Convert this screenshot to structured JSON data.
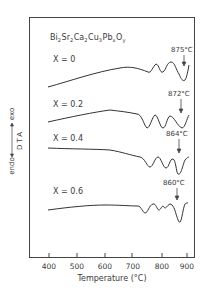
{
  "chart_data": {
    "type": "line",
    "formula": {
      "parts": [
        {
          "base": "Bi",
          "sub": "2"
        },
        {
          "base": "Sr",
          "sub": "2"
        },
        {
          "base": "Ca",
          "sub": "2"
        },
        {
          "base": "Cu",
          "sub": "3"
        },
        {
          "base": "Pb",
          "sub": "x"
        },
        {
          "base": "O",
          "sub": "y"
        }
      ]
    },
    "xlabel": "Temperature (°C)",
    "ylabel": "DTA",
    "ylabel_exo": "exo",
    "ylabel_endo": "endo",
    "xlim": [
      380,
      920
    ],
    "x_ticks": [
      400,
      500,
      600,
      700,
      800,
      900
    ],
    "x_tick_labels": [
      "400",
      "500",
      "600",
      "700",
      "800",
      "900"
    ],
    "grid": false,
    "series": [
      {
        "name": "X = 0",
        "peak_label": "875°C",
        "peak_temp": 875,
        "points": [
          [
            400,
            0.0
          ],
          [
            500,
            0.8
          ],
          [
            600,
            1.4
          ],
          [
            660,
            1.5
          ],
          [
            700,
            1.3
          ],
          [
            740,
            1.1
          ],
          [
            765,
            0.7
          ],
          [
            780,
            1.1
          ],
          [
            800,
            0.5
          ],
          [
            820,
            1.2
          ],
          [
            840,
            1.0
          ],
          [
            860,
            0.3
          ],
          [
            875,
            -0.5
          ],
          [
            890,
            0.3
          ],
          [
            900,
            1.1
          ]
        ]
      },
      {
        "name": "X = 0.2",
        "peak_label": "872°C",
        "peak_temp": 872,
        "points": [
          [
            400,
            0.0
          ],
          [
            500,
            0.7
          ],
          [
            600,
            1.0
          ],
          [
            650,
            0.9
          ],
          [
            700,
            0.8
          ],
          [
            720,
            0.1
          ],
          [
            745,
            -0.5
          ],
          [
            770,
            0.8
          ],
          [
            790,
            -0.1
          ],
          [
            800,
            -0.5
          ],
          [
            815,
            0.8
          ],
          [
            840,
            0.7
          ],
          [
            860,
            -0.2
          ],
          [
            872,
            -0.5
          ],
          [
            885,
            0.2
          ],
          [
            900,
            0.9
          ]
        ]
      },
      {
        "name": "X = 0.4",
        "peak_label": "864°C",
        "peak_temp": 864,
        "points": [
          [
            400,
            0.0
          ],
          [
            500,
            -0.1
          ],
          [
            600,
            -0.3
          ],
          [
            650,
            -0.6
          ],
          [
            700,
            -0.9
          ],
          [
            730,
            -1.1
          ],
          [
            750,
            -1.8
          ],
          [
            770,
            -1.0
          ],
          [
            790,
            -1.9
          ],
          [
            800,
            -1.9
          ],
          [
            815,
            -0.9
          ],
          [
            840,
            -1.1
          ],
          [
            855,
            -2.0
          ],
          [
            864,
            -2.5
          ],
          [
            880,
            -1.3
          ],
          [
            900,
            -0.5
          ]
        ]
      },
      {
        "name": "X = 0.6",
        "peak_label": "860°C",
        "peak_temp": 860,
        "points": [
          [
            400,
            0.0
          ],
          [
            500,
            0.3
          ],
          [
            600,
            0.5
          ],
          [
            700,
            0.4
          ],
          [
            730,
            0.3
          ],
          [
            745,
            -0.6
          ],
          [
            760,
            0.0
          ],
          [
            785,
            0.6
          ],
          [
            800,
            0.0
          ],
          [
            815,
            0.3
          ],
          [
            825,
            -0.2
          ],
          [
            840,
            0.3
          ],
          [
            850,
            -0.2
          ],
          [
            860,
            -1.5
          ],
          [
            872,
            -1.2
          ],
          [
            885,
            0.2
          ],
          [
            900,
            0.3
          ]
        ]
      }
    ]
  }
}
